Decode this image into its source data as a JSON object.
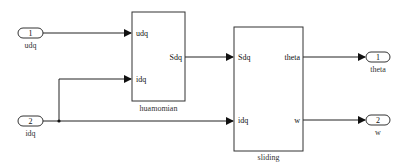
{
  "inports": [
    {
      "number": "1",
      "label": "udq"
    },
    {
      "number": "2",
      "label": "idq"
    }
  ],
  "outports": [
    {
      "number": "1",
      "label": "theta"
    },
    {
      "number": "2",
      "label": "w"
    }
  ],
  "blocks": {
    "huamomian": {
      "name": "huamomian",
      "inputs": [
        "udq",
        "idq"
      ],
      "outputs": [
        "Sdq"
      ]
    },
    "sliding": {
      "name": "sliding",
      "inputs": [
        "Sdq",
        "idq"
      ],
      "outputs": [
        "theta",
        "w"
      ]
    }
  },
  "colors": {
    "line": "#222222",
    "block_border": "#333333",
    "background": "#ffffff"
  }
}
